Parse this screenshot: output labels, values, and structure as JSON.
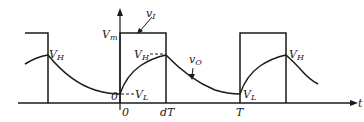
{
  "diagram": {
    "type": "waveform",
    "axes": {
      "x_label": "t",
      "y_level_label": "V_m"
    },
    "signals": [
      {
        "name": "v_I",
        "kind": "square-wave"
      },
      {
        "name": "v_O",
        "kind": "exponential charge/discharge"
      }
    ],
    "labels": {
      "vI": {
        "main": "v",
        "sub": "I"
      },
      "vO": {
        "main": "v",
        "sub": "O"
      },
      "Vm": {
        "main": "V",
        "sub": "m"
      },
      "VH_left": {
        "main": "V",
        "sub": "H"
      },
      "VH_mid": {
        "main": "V",
        "sub": "H"
      },
      "VH_right": {
        "main": "V",
        "sub": "H"
      },
      "VL_mid": {
        "main": "V",
        "sub": "L"
      },
      "VL_right": {
        "main": "V",
        "sub": "L"
      },
      "origin_zero": "0",
      "tick_0": "0",
      "tick_dT": "dT",
      "tick_T": "T",
      "t_axis": "t"
    },
    "colors": {
      "stroke": "#1a1a1a",
      "background": "#ffffff"
    }
  }
}
